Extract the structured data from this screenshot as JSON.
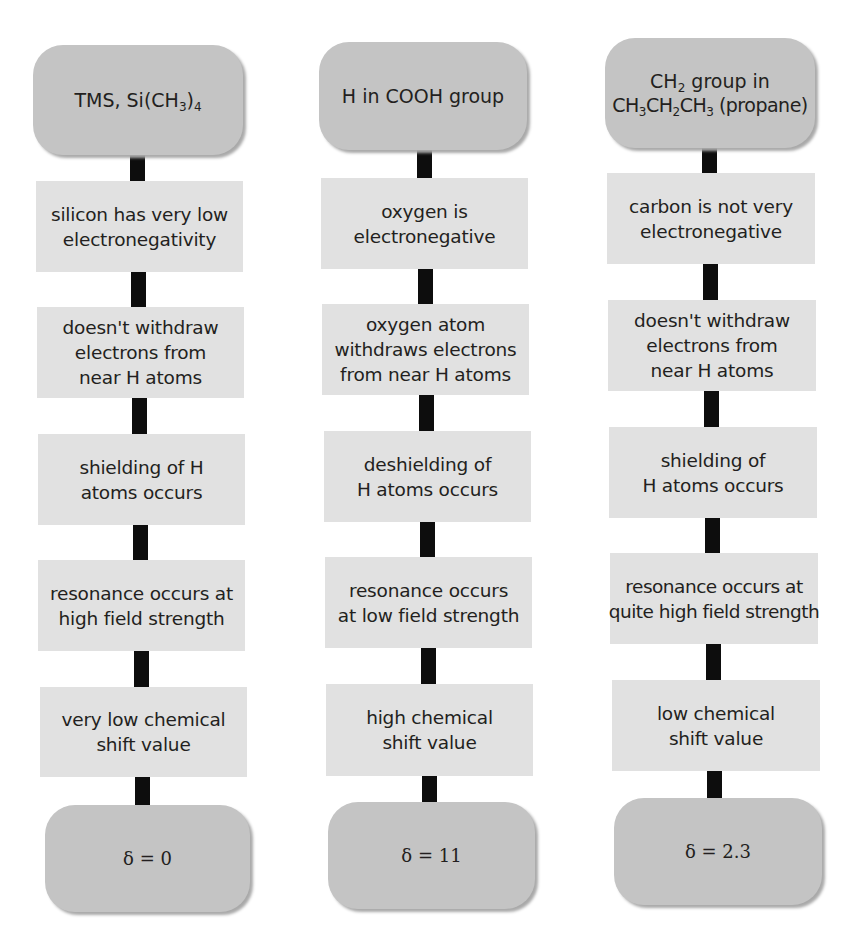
{
  "columns": [
    {
      "top": {
        "line1_pre": "TMS, Si(CH",
        "line1_sub1": "3",
        "line1_mid": ")",
        "line1_sub2": "4"
      },
      "steps": [
        {
          "lines": [
            "silicon has very low",
            "electronegativity"
          ]
        },
        {
          "lines": [
            "doesn't withdraw",
            "electrons from",
            "near H atoms"
          ]
        },
        {
          "lines": [
            "shielding of H",
            "atoms occurs"
          ]
        },
        {
          "lines": [
            "resonance occurs at",
            "high field strength"
          ]
        },
        {
          "lines": [
            "very low chemical",
            "shift value"
          ]
        }
      ],
      "result": "δ = 0"
    },
    {
      "top": {
        "line1": "H in COOH group"
      },
      "steps": [
        {
          "lines": [
            "oxygen is",
            "electronegative"
          ]
        },
        {
          "lines": [
            "oxygen atom",
            "withdraws electrons",
            "from near H atoms"
          ]
        },
        {
          "lines": [
            "deshielding of",
            "H atoms occurs"
          ]
        },
        {
          "lines": [
            "resonance occurs",
            "at low field strength"
          ]
        },
        {
          "lines": [
            "high chemical",
            "shift value"
          ]
        }
      ],
      "result": "δ = 11"
    },
    {
      "top": {
        "l1_pre": "CH",
        "l1_sub": "2",
        "l1_post": " group in",
        "l2_a": "CH",
        "l2_s1": "3",
        "l2_b": "CH",
        "l2_s2": "2",
        "l2_c": "CH",
        "l2_s3": "3",
        "l2_post": " (propane)"
      },
      "steps": [
        {
          "lines": [
            "carbon is not very",
            "electronegative"
          ]
        },
        {
          "lines": [
            "doesn't withdraw",
            "electrons from",
            "near H atoms"
          ]
        },
        {
          "lines": [
            "shielding of",
            "H atoms occurs"
          ]
        },
        {
          "lines": [
            "resonance occurs at",
            "quite high field strength"
          ]
        },
        {
          "lines": [
            "low chemical",
            "shift value"
          ]
        }
      ],
      "result": "δ = 2.3"
    }
  ],
  "colors": {
    "rounded_box": "#c4c4c4",
    "step_box": "#e1e1e1",
    "connector": "#0d0d0d",
    "text": "#231f20"
  }
}
